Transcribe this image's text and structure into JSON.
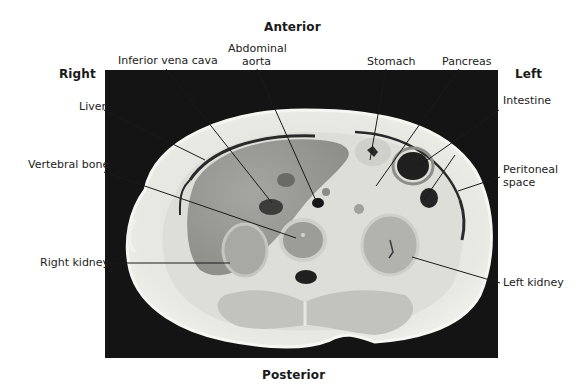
{
  "figure": {
    "orientation": {
      "anterior": "Anterior",
      "posterior": "Posterior",
      "right": "Right",
      "left": "Left"
    },
    "labels": {
      "inferior_vena_cava": "Inferior vena cava",
      "abdominal_aorta_line1": "Abdominal",
      "abdominal_aorta_line2": "aorta",
      "stomach": "Stomach",
      "pancreas": "Pancreas",
      "liver": "Liver",
      "intestine": "Intestine",
      "vertebral_bone": "Vertebral bone",
      "peritoneal_space_line1": "Peritoneal",
      "peritoneal_space_line2": "space",
      "right_kidney": "Right kidney",
      "left_kidney": "Left kidney"
    },
    "colors": {
      "background": "#141414",
      "tissue_light": "#e6e6e2",
      "tissue_mid": "#c9c9c4",
      "organ_gray": "#9a9a96",
      "dark_structure": "#1e1e1e",
      "leader_line": "#1a1a1a"
    }
  }
}
